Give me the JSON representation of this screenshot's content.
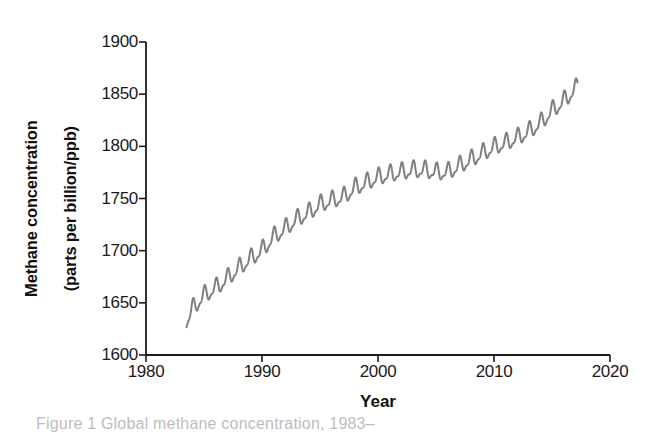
{
  "figure": {
    "caption_truncated": "Figure 1 Global methane concentration, 1983–",
    "line_color": "#808080",
    "axis_color": "#1a1a1a",
    "background": "#ffffff"
  },
  "chart_data": {
    "type": "line",
    "title": "",
    "xlabel": "Year",
    "ylabel": "Methane concentration (parts per billion/ppb)",
    "ylabel_line1": "Methane concentration",
    "ylabel_line2": "(parts per billion/ppb)",
    "xlim": [
      1980,
      2020
    ],
    "ylim": [
      1600,
      1900
    ],
    "xticks": [
      1980,
      1990,
      2000,
      2010,
      2020
    ],
    "xtick_labels": [
      "1980",
      "1990",
      "2000",
      "2010",
      "2020"
    ],
    "yticks": [
      1600,
      1650,
      1700,
      1750,
      1800,
      1850,
      1900
    ],
    "ytick_labels": [
      "1600",
      "1650",
      "1700",
      "1750",
      "1800",
      "1850",
      "1900"
    ],
    "grid": false,
    "legend": null,
    "series": [
      {
        "name": "Globally averaged atmospheric methane",
        "color": "#808080",
        "line_width": 2,
        "seasonal_amplitude_ppb": 7,
        "seasonal_period_years": 1,
        "annual_mean": {
          "x": [
            1983.5,
            1984,
            1985,
            1986,
            1987,
            1988,
            1989,
            1990,
            1991,
            1992,
            1993,
            1994,
            1995,
            1996,
            1997,
            1998,
            1999,
            2000,
            2001,
            2002,
            2003,
            2004,
            2005,
            2006,
            2007,
            2008,
            2009,
            2010,
            2011,
            2012,
            2013,
            2014,
            2015,
            2016,
            2017.2
          ],
          "y": [
            1632,
            1644,
            1657,
            1664,
            1673,
            1683,
            1692,
            1700,
            1713,
            1721,
            1730,
            1736,
            1744,
            1748,
            1751,
            1760,
            1765,
            1770,
            1773,
            1775,
            1777,
            1777,
            1775,
            1775,
            1781,
            1787,
            1793,
            1799,
            1803,
            1808,
            1814,
            1822,
            1834,
            1843,
            1857
          ]
        }
      }
    ]
  }
}
